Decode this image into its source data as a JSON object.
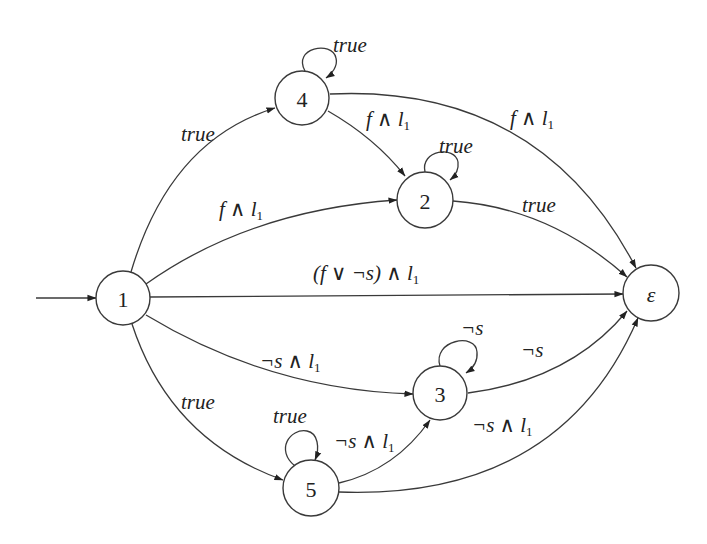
{
  "diagram": {
    "title": "",
    "type": "automaton",
    "initial_state": "1",
    "states": [
      {
        "id": "1",
        "label": "1",
        "cx": 123,
        "cy": 298
      },
      {
        "id": "4",
        "label": "4",
        "cx": 302,
        "cy": 98
      },
      {
        "id": "2",
        "label": "2",
        "cx": 425,
        "cy": 200
      },
      {
        "id": "eps",
        "label": "ε",
        "cx": 651,
        "cy": 293
      },
      {
        "id": "3",
        "label": "3",
        "cx": 440,
        "cy": 393
      },
      {
        "id": "5",
        "label": "5",
        "cx": 311,
        "cy": 488
      }
    ],
    "edges": [
      {
        "from": "start",
        "to": "1",
        "label": ""
      },
      {
        "from": "1",
        "to": "4",
        "label": "true"
      },
      {
        "from": "4",
        "to": "4",
        "label": "true"
      },
      {
        "from": "4",
        "to": "2",
        "label": "f ∧ l1"
      },
      {
        "from": "4",
        "to": "eps",
        "label": "f ∧ l1"
      },
      {
        "from": "1",
        "to": "2",
        "label": "f ∧ l1"
      },
      {
        "from": "2",
        "to": "2",
        "label": "true"
      },
      {
        "from": "2",
        "to": "eps",
        "label": "true"
      },
      {
        "from": "1",
        "to": "eps",
        "label": "(f ∨ ¬s) ∧ l1"
      },
      {
        "from": "1",
        "to": "3",
        "label": "¬s ∧ l1"
      },
      {
        "from": "3",
        "to": "3",
        "label": "¬s"
      },
      {
        "from": "3",
        "to": "eps",
        "label": "¬s"
      },
      {
        "from": "1",
        "to": "5",
        "label": "true"
      },
      {
        "from": "5",
        "to": "5",
        "label": "true"
      },
      {
        "from": "5",
        "to": "3",
        "label": "¬s ∧ l1"
      },
      {
        "from": "5",
        "to": "eps",
        "label": "¬s ∧ l1"
      }
    ],
    "labels": {
      "e_1_4": "true",
      "e_4_4": "true",
      "e_4_2_main": "f ∧ l",
      "e_4_eps_main": "f ∧ l",
      "e_1_2_main": "f ∧ l",
      "e_2_2": "true",
      "e_2_eps": "true",
      "e_1_eps_main": "(f ∨ ¬s) ∧ l",
      "e_1_3_main": "¬s ∧ l",
      "e_3_3": "¬s",
      "e_3_eps": "¬s",
      "e_1_5": "true",
      "e_5_5": "true",
      "e_5_3_main": "¬s ∧ l",
      "e_5_eps_main": "¬s ∧ l",
      "subscript": "1"
    },
    "node_labels": {
      "n1": "1",
      "n4": "4",
      "n2": "2",
      "neps": "ε",
      "n3": "3",
      "n5": "5"
    },
    "colors": {
      "stroke": "#3a3a3a",
      "text": "#222222",
      "background": "#ffffff"
    }
  }
}
